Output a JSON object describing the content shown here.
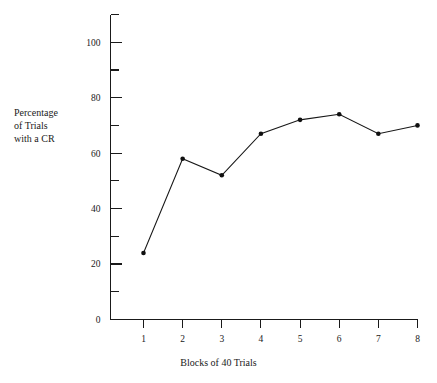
{
  "chart_data": {
    "type": "line",
    "title": "",
    "xlabel": "Blocks of 40 Trials",
    "ylabel": "Percentage\nof Trials\nwith a CR",
    "ylabel_lines": [
      "Percentage",
      "of Trials",
      "with a CR"
    ],
    "x": [
      1,
      2,
      3,
      4,
      5,
      6,
      7,
      8
    ],
    "categories": [
      "1",
      "2",
      "3",
      "4",
      "5",
      "6",
      "7",
      "8"
    ],
    "values": [
      24,
      58,
      52,
      67,
      72,
      74,
      67,
      70
    ],
    "series": [
      {
        "name": "Percentage of Trials with a CR",
        "values": [
          24,
          58,
          52,
          67,
          72,
          74,
          67,
          70
        ]
      }
    ],
    "xlim": [
      0.5,
      8.2
    ],
    "ylim": [
      0,
      110
    ],
    "ytick_labels": [
      "0",
      "20",
      "40",
      "60",
      "80",
      "100"
    ],
    "ytick_values": [
      0,
      20,
      40,
      60,
      80,
      100
    ],
    "yminor_values": [
      10,
      30,
      50,
      70,
      90,
      110
    ],
    "xtick_labels": [
      "1",
      "2",
      "3",
      "4",
      "5",
      "6",
      "7",
      "8"
    ],
    "xtick_values": [
      1,
      2,
      3,
      4,
      5,
      6,
      7,
      8
    ],
    "grid": false,
    "legend": false,
    "marker": "filled-circle",
    "line_color": "#171717",
    "marker_color": "#101010",
    "axis_color": "#1a1a1a",
    "background_color": "#ffffff"
  }
}
